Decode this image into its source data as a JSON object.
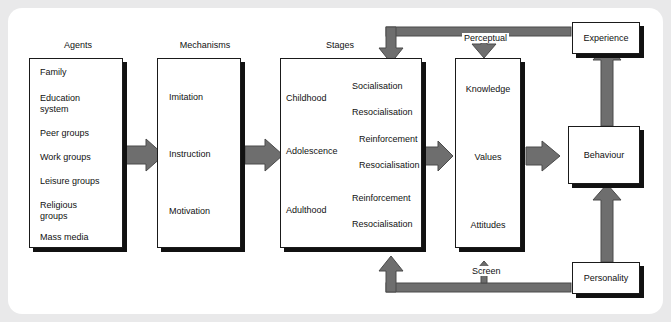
{
  "diagram": {
    "colors": {
      "arrow_gray": "#6e6e6e",
      "box_border": "#1a1a1a",
      "shadow": "#111111",
      "page_bg": "#e9e9ea",
      "canvas_bg": "#ffffff",
      "text": "#111111"
    },
    "columns": [
      {
        "title": "Agents",
        "items": [
          "Family",
          "Education\nsystem",
          "Peer groups",
          "Work groups",
          "Leisure groups",
          "Religious\ngroups",
          "Mass media"
        ]
      },
      {
        "title": "Mechanisms",
        "items": [
          "Imitation",
          "Instruction",
          "Motivation"
        ]
      },
      {
        "title": "Stages",
        "stages": [
          {
            "name": "Childhood",
            "branches": [
              "Socialisation",
              "Resocialisation"
            ]
          },
          {
            "name": "Adolescence",
            "branches": [
              "Reinforcement",
              "Resocialisation"
            ]
          },
          {
            "name": "Adulthood",
            "branches": [
              "Reinforcement",
              "Resocialisation"
            ]
          }
        ]
      }
    ],
    "agents": {
      "item_0": "Family",
      "item_1a": "Education",
      "item_1b": "system",
      "item_2": "Peer groups",
      "item_3": "Work groups",
      "item_4": "Leisure groups",
      "item_5a": "Religious",
      "item_5b": "groups",
      "item_6": "Mass media"
    },
    "mechanisms": {
      "item_0": "Imitation",
      "item_1": "Instruction",
      "item_2": "Motivation"
    },
    "stages": {
      "s0_name": "Childhood",
      "s0_b0": "Socialisation",
      "s0_b1": "Resocialisation",
      "s1_name": "Adolescence",
      "s1_b0": "Reinforcement",
      "s1_b1": "Resocialisation",
      "s2_name": "Adulthood",
      "s2_b0": "Reinforcement",
      "s2_b1": "Resocialisation"
    },
    "cognitive": {
      "level_0": "Knowledge",
      "level_1": "Values",
      "level_2": "Attitudes"
    },
    "outcomes": {
      "experience": "Experience",
      "behaviour": "Behaviour",
      "personality": "Personality"
    },
    "feedback": {
      "top_label": "Perceptual",
      "bottom_label": "Screen"
    }
  }
}
